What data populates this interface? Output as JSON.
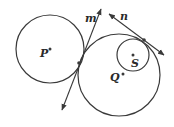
{
  "diagram": {
    "circles": [
      {
        "id": "P",
        "label": "P"
      },
      {
        "id": "Q",
        "label": "Q"
      },
      {
        "id": "S",
        "label": "S"
      }
    ],
    "lines": [
      {
        "id": "m",
        "label": "m",
        "tangent_to": [
          "P",
          "Q"
        ]
      },
      {
        "id": "n",
        "label": "n",
        "tangent_to": [
          "Q",
          "S"
        ]
      }
    ],
    "stroke_color": "#3a3a3a"
  }
}
